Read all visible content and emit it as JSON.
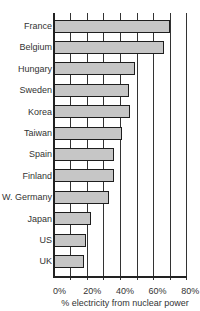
{
  "chart_data": {
    "type": "bar",
    "orientation": "horizontal",
    "title": "",
    "xlabel": "% electricity from nuclear power",
    "ylabel": "",
    "xlim": [
      0,
      80
    ],
    "x_ticks": [
      "0%",
      "20%",
      "40%",
      "60%",
      "80%"
    ],
    "grid": true,
    "grid_interval": 10,
    "legend": null,
    "categories": [
      "France",
      "Belgium",
      "Hungary",
      "Sweden",
      "Korea",
      "Taiwan",
      "Spain",
      "Finland",
      "W. Germany",
      "Japan",
      "US",
      "UK"
    ],
    "values": [
      70,
      66,
      49,
      45,
      46,
      41,
      36,
      36,
      33,
      22,
      19,
      18
    ],
    "bar_color": "#c6c6c6",
    "bar_edge_color": "#1e1e1e"
  },
  "axis": {
    "ticks": [
      {
        "label": "0%",
        "value": 0
      },
      {
        "label": "20%",
        "value": 20
      },
      {
        "label": "40%",
        "value": 40
      },
      {
        "label": "60%",
        "value": 60
      },
      {
        "label": "80%",
        "value": 80
      }
    ],
    "xlabel": "% electricity from nuclear power"
  }
}
